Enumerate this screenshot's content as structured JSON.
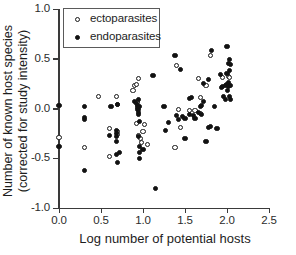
{
  "chart_data": {
    "type": "scatter",
    "title": "",
    "xlabel": "Log number of potential hosts",
    "ylabel_line1": "Number of known host species",
    "ylabel_line2": "(corrected for study intensity)",
    "xlim": [
      0.0,
      2.5
    ],
    "ylim": [
      -1.0,
      1.0
    ],
    "xticks": [
      "0.0",
      "0.5",
      "1.0",
      "1.5",
      "2.0",
      "2.5"
    ],
    "xtick_values": [
      0.0,
      0.5,
      1.0,
      1.5,
      2.0,
      2.5
    ],
    "yticks": [
      "1.0",
      "0.5",
      "0.0",
      "-0.5",
      "-1.0"
    ],
    "ytick_values": [
      1.0,
      0.5,
      0.0,
      -0.5,
      -1.0
    ],
    "grid": false,
    "legend_position": "top-left",
    "series": [
      {
        "name": "ectoparasites",
        "marker": "open-circle",
        "color": "#ffffff",
        "edge_color": "#181818",
        "points": [
          [
            0.0,
            -0.29
          ],
          [
            0.3,
            -0.39
          ],
          [
            0.47,
            0.12
          ],
          [
            0.6,
            -0.2
          ],
          [
            0.6,
            -0.48
          ],
          [
            0.68,
            0.12
          ],
          [
            0.7,
            0.04
          ],
          [
            0.7,
            -0.23
          ],
          [
            0.7,
            -0.26
          ],
          [
            0.88,
            0.18
          ],
          [
            0.9,
            0.23
          ],
          [
            0.92,
            0.24
          ],
          [
            0.93,
            0.07
          ],
          [
            0.93,
            0.06
          ],
          [
            0.92,
            -0.15
          ],
          [
            0.95,
            0.3
          ],
          [
            0.95,
            -0.27
          ],
          [
            0.97,
            -0.3
          ],
          [
            0.98,
            -0.34
          ],
          [
            1.0,
            -0.23
          ],
          [
            1.02,
            -0.16
          ],
          [
            1.05,
            -0.36
          ],
          [
            1.38,
            -0.39
          ],
          [
            1.4,
            0.43
          ],
          [
            1.42,
            -0.01
          ],
          [
            1.45,
            -0.19
          ],
          [
            1.55,
            -0.02
          ],
          [
            1.62,
            -0.02
          ],
          [
            1.66,
            0.3
          ],
          [
            1.68,
            0.11
          ],
          [
            1.68,
            -0.05
          ],
          [
            1.75,
            0.23
          ],
          [
            1.8,
            0.53
          ],
          [
            1.95,
            0.31
          ],
          [
            2.02,
            0.32
          ],
          [
            2.03,
            0.31
          ]
        ]
      },
      {
        "name": "endoparasites",
        "marker": "filled-circle",
        "color": "#121212",
        "points": [
          [
            0.0,
            0.03
          ],
          [
            0.0,
            -0.38
          ],
          [
            0.3,
            0.02
          ],
          [
            0.3,
            -0.09
          ],
          [
            0.3,
            -0.11
          ],
          [
            0.3,
            -0.62
          ],
          [
            0.6,
            -0.27
          ],
          [
            0.62,
            0.02
          ],
          [
            0.68,
            -0.22
          ],
          [
            0.68,
            -0.25
          ],
          [
            0.68,
            -0.28
          ],
          [
            0.68,
            -0.33
          ],
          [
            0.68,
            -0.46
          ],
          [
            0.7,
            0.04
          ],
          [
            0.7,
            -0.54
          ],
          [
            0.72,
            -0.44
          ],
          [
            0.9,
            0.07
          ],
          [
            0.92,
            0.05
          ],
          [
            0.93,
            0.03
          ],
          [
            0.93,
            0.01
          ],
          [
            0.94,
            -0.01
          ],
          [
            0.95,
            0.09
          ],
          [
            0.95,
            -0.04
          ],
          [
            0.95,
            -0.06
          ],
          [
            0.96,
            0.02
          ],
          [
            0.96,
            -0.13
          ],
          [
            0.95,
            -0.28
          ],
          [
            0.96,
            -0.38
          ],
          [
            0.96,
            -0.44
          ],
          [
            0.96,
            -0.5
          ],
          [
            1.0,
            -0.41
          ],
          [
            1.12,
            0.33
          ],
          [
            1.15,
            -0.8
          ],
          [
            1.25,
            0.02
          ],
          [
            1.27,
            -0.22
          ],
          [
            1.3,
            -0.14
          ],
          [
            1.38,
            0.53
          ],
          [
            1.4,
            -0.07
          ],
          [
            1.42,
            -0.11
          ],
          [
            1.45,
            0.39
          ],
          [
            1.47,
            -0.08
          ],
          [
            1.5,
            -0.1
          ],
          [
            1.5,
            -0.3
          ],
          [
            1.55,
            0.1
          ],
          [
            1.55,
            -0.06
          ],
          [
            1.58,
            0.11
          ],
          [
            1.6,
            -0.07
          ],
          [
            1.62,
            -0.1
          ],
          [
            1.66,
            -0.04
          ],
          [
            1.68,
            0.02
          ],
          [
            1.7,
            0.03
          ],
          [
            1.7,
            -0.06
          ],
          [
            1.72,
            0.25
          ],
          [
            1.72,
            0.07
          ],
          [
            1.75,
            -0.33
          ],
          [
            1.78,
            0.29
          ],
          [
            1.78,
            -0.19
          ],
          [
            1.8,
            -0.18
          ],
          [
            1.82,
            0.58
          ],
          [
            1.85,
            0.02
          ],
          [
            1.88,
            -0.2
          ],
          [
            1.92,
            0.34
          ],
          [
            1.93,
            0.21
          ],
          [
            1.95,
            0.22
          ],
          [
            1.96,
            0.12
          ],
          [
            1.98,
            0.23
          ],
          [
            1.98,
            0.09
          ],
          [
            2.0,
            0.62
          ],
          [
            2.0,
            0.35
          ],
          [
            2.0,
            0.24
          ],
          [
            2.01,
            0.18
          ],
          [
            2.02,
            0.45
          ],
          [
            2.02,
            0.26
          ],
          [
            2.02,
            0.22
          ],
          [
            2.03,
            0.49
          ],
          [
            2.03,
            0.38
          ],
          [
            2.03,
            0.12
          ],
          [
            2.04,
            0.44
          ],
          [
            2.04,
            0.23
          ],
          [
            2.04,
            0.09
          ]
        ]
      }
    ]
  },
  "legend": {
    "items": [
      {
        "label": "ectoparasites",
        "marker": "open-circle"
      },
      {
        "label": "endoparasites",
        "marker": "filled-circle"
      }
    ]
  }
}
